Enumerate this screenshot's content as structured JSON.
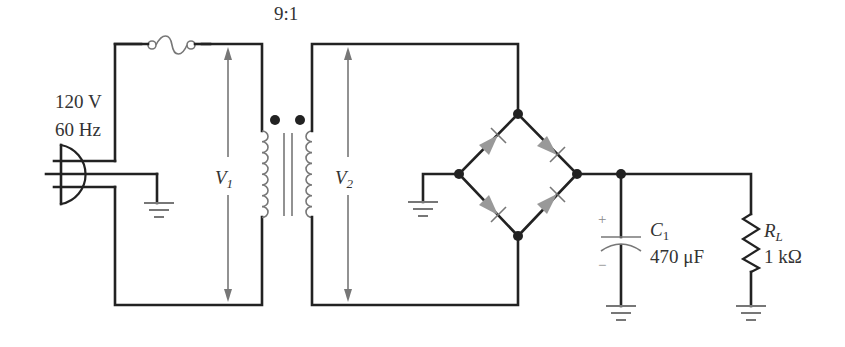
{
  "diagram": {
    "source": {
      "voltage_label": "120 V",
      "frequency_label": "60 Hz",
      "symbol": "ac-plug"
    },
    "fuse": {
      "symbol": "fuse"
    },
    "transformer": {
      "ratio_label": "9:1",
      "primary_voltage": {
        "symbol": "V",
        "subscript": "1"
      },
      "secondary_voltage": {
        "symbol": "V",
        "subscript": "2"
      }
    },
    "bridge": {
      "diodes": 4,
      "diode_color": "#999999"
    },
    "capacitor": {
      "name": "C",
      "subscript": "1",
      "value_label": "470 μF",
      "plus_label": "+",
      "minus_label": "−"
    },
    "load": {
      "name": "R",
      "subscript": "L",
      "value_label": "1 kΩ"
    },
    "colors": {
      "wire": "#222222",
      "component": "#777777",
      "text": "#333333",
      "background": "#ffffff"
    }
  }
}
